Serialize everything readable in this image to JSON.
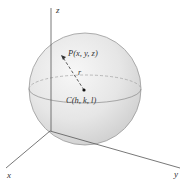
{
  "diagram": {
    "axes": {
      "x_label": "x",
      "y_label": "y",
      "z_label": "z"
    },
    "point_p": "P(x, y, z)",
    "center_c": "C(h, k, l)",
    "radius_label": "r",
    "colors": {
      "axis": "#555555",
      "sphere_fill": "#e8e8e8",
      "sphere_edge": "#9a9a9a",
      "text": "#333333"
    }
  }
}
